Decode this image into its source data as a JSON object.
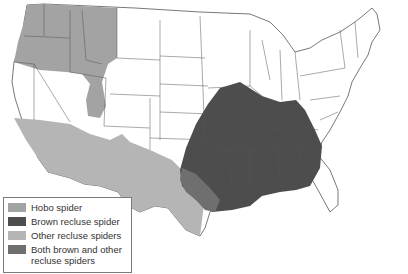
{
  "map": {
    "title": "",
    "region": "Contiguous United States",
    "colors": {
      "hobo": "#a3a3a3",
      "brown_recluse": "#4d4d4d",
      "other_recluse": "#b5b5b5",
      "both": "#6f6f6f",
      "state_border": "#555555",
      "land": "#ffffff"
    }
  },
  "legend": {
    "items": [
      {
        "label": "Hobo spider",
        "color": "#a3a3a3"
      },
      {
        "label": "Brown recluse spider",
        "color": "#4d4d4d"
      },
      {
        "label": "Other recluse spiders",
        "color": "#b5b5b5"
      },
      {
        "label": "Both brown and other recluse spiders",
        "color": "#6f6f6f"
      }
    ]
  }
}
